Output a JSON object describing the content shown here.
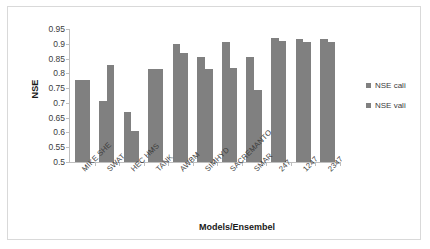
{
  "chart_data": {
    "type": "bar",
    "title": "",
    "xlabel": "Models/Ensembel",
    "ylabel": "NSE",
    "ylim": [
      0.5,
      0.95
    ],
    "ytick_labels": [
      "0.95",
      "0.9",
      "0.85",
      "0.8",
      "0.75",
      "0.7",
      "0.65",
      "0.6",
      "0.55",
      "0.5"
    ],
    "ytick_values": [
      0.95,
      0.9,
      0.85,
      0.8,
      0.75,
      0.7,
      0.65,
      0.6,
      0.55,
      0.5
    ],
    "grid": false,
    "legend_position": "right",
    "categories": [
      "MIKE SHE",
      "SWAT",
      "HEC HMS",
      "TANK",
      "AWBM",
      "SIMHYD",
      "SACREMANTO",
      "SMAR",
      "247",
      "1247",
      "2347"
    ],
    "series": [
      {
        "name": "NSE cali",
        "color": "#808080",
        "values": [
          0.778,
          0.706,
          0.67,
          0.816,
          0.898,
          0.857,
          0.905,
          0.857,
          0.918,
          0.917,
          0.917
        ]
      },
      {
        "name": "NSE vali",
        "color": "#808080",
        "values": [
          null,
          0.829,
          0.605,
          null,
          0.868,
          0.815,
          0.818,
          0.745,
          0.908,
          0.906,
          0.905
        ]
      }
    ]
  },
  "legend": {
    "items": [
      {
        "label": "NSE cali",
        "color": "#808080"
      },
      {
        "label": "NSE vali",
        "color": "#808080"
      }
    ]
  }
}
